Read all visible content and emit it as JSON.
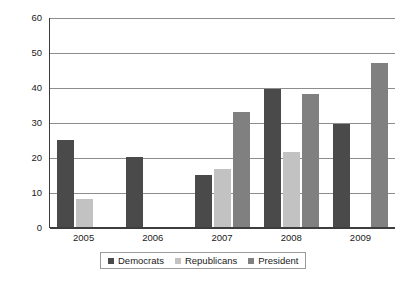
{
  "chart_data": {
    "type": "bar",
    "title": "",
    "subtitle": "",
    "xlabel": "",
    "ylabel": "Percent of Cases",
    "categories": [
      "2005",
      "2006",
      "2007",
      "2008",
      "2009"
    ],
    "series": [
      {
        "name": "Democrats",
        "color": "#4a4a4a",
        "values": [
          25,
          20,
          15,
          39.5,
          29.5
        ]
      },
      {
        "name": "Republicans",
        "color": "#c2c2c2",
        "values": [
          8,
          null,
          16.5,
          21.5,
          null
        ]
      },
      {
        "name": "President",
        "color": "#808080",
        "values": [
          null,
          null,
          33,
          38,
          47
        ]
      }
    ],
    "ylim": [
      0,
      60
    ],
    "yticks": [
      60,
      50,
      40,
      30,
      20,
      10,
      0
    ],
    "ytick_labels": [
      "60",
      "50",
      "40",
      "30",
      "20",
      "10",
      "0"
    ],
    "grid": true,
    "grid_axis": "y",
    "legend_position": "bottom-center",
    "legend_entries": [
      "Democrats",
      "Republicans",
      "President"
    ]
  },
  "axes": {
    "y_title": "Percent of Cases"
  },
  "legend": {
    "items": [
      {
        "label": "Democrats"
      },
      {
        "label": "Republicans"
      },
      {
        "label": "President"
      }
    ]
  }
}
